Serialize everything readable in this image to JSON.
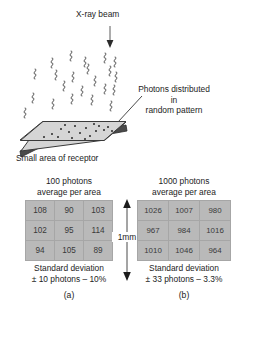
{
  "figure": {
    "upper_diagram": {
      "beam_label": "X-ray beam",
      "photons_label": "Photons distributed\nin\nrandom pattern",
      "photons_label_line1": "Photons distributed",
      "photons_label_line2": "in",
      "photons_label_line3": "random pattern",
      "receptor_label": "Small area of receptor",
      "photon_symbol": "squiggle-wave",
      "arrow_icon": "down-arrow-icon",
      "pointer_icon": "leader-line-icon",
      "receptor_fill": "#d4d4d4",
      "receptor_edge": "#3a3a3a"
    },
    "scale": {
      "label": "1mm",
      "icon": "double-headed-vertical-arrow-icon"
    },
    "panels": [
      {
        "id": "a",
        "title_line1": "100 photons",
        "title_line2": "average per area",
        "grid": [
          [
            "108",
            "90",
            "103"
          ],
          [
            "102",
            "95",
            "114"
          ],
          [
            "94",
            "105",
            "89"
          ]
        ],
        "sd_line1": "Standard deviation",
        "sd_line2": "± 10 photons – 10%",
        "sublabel": "(a)",
        "cell_fill": "#b9b9b9",
        "cell_border": "#a6a6a6"
      },
      {
        "id": "b",
        "title_line1": "1000 photons",
        "title_line2": "average per area",
        "grid": [
          [
            "1026",
            "1007",
            "980"
          ],
          [
            "967",
            "984",
            "1016"
          ],
          [
            "1010",
            "1046",
            "964"
          ]
        ],
        "sd_line1": "Standard deviation",
        "sd_line2": "± 33 photons – 3.3%",
        "sublabel": "(b)",
        "cell_fill": "#b9b9b9",
        "cell_border": "#a6a6a6"
      }
    ]
  }
}
